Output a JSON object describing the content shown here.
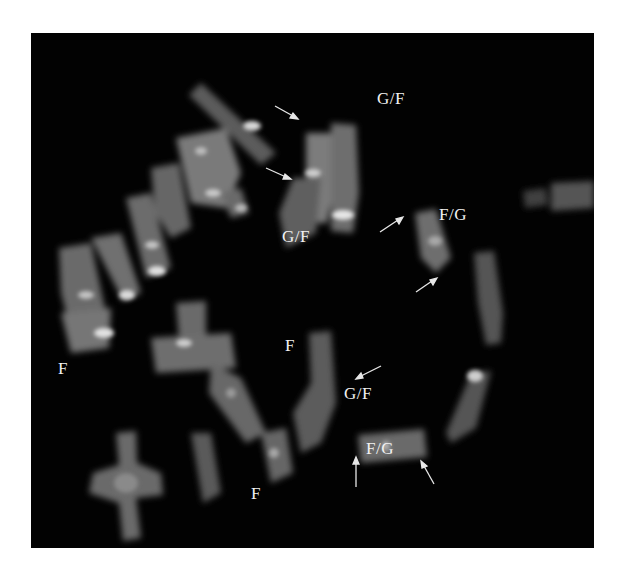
{
  "figure": {
    "type": "fluorescence metaphase chromosome spread",
    "background_color": "#020202",
    "label_color": "#f2f2f2",
    "labels": [
      {
        "id": "gf-top-right",
        "text": "G/F",
        "x": 346,
        "y": 57
      },
      {
        "id": "gf-top-center",
        "text": "G/F",
        "x": 251,
        "y": 195
      },
      {
        "id": "fg-right",
        "text": "F/G",
        "x": 408,
        "y": 173
      },
      {
        "id": "f-left",
        "text": "F",
        "x": 27,
        "y": 327
      },
      {
        "id": "f-center",
        "text": "F",
        "x": 254,
        "y": 304
      },
      {
        "id": "gf-bottom",
        "text": "G/F",
        "x": 313,
        "y": 352
      },
      {
        "id": "fg-bottom",
        "text": "F/G",
        "x": 335,
        "y": 407
      },
      {
        "id": "f-bottom",
        "text": "F",
        "x": 220,
        "y": 452
      }
    ],
    "arrows": [
      {
        "id": "arrow-1",
        "x1": 244,
        "y1": 73,
        "x2": 266,
        "y2": 85
      },
      {
        "id": "arrow-2",
        "x1": 235,
        "y1": 135,
        "x2": 259,
        "y2": 146
      },
      {
        "id": "arrow-3",
        "x1": 349,
        "y1": 199,
        "x2": 371,
        "y2": 185
      },
      {
        "id": "arrow-4",
        "x1": 385,
        "y1": 259,
        "x2": 405,
        "y2": 246
      },
      {
        "id": "arrow-5",
        "x1": 350,
        "y1": 333,
        "x2": 326,
        "y2": 345
      },
      {
        "id": "arrow-6",
        "x1": 325,
        "y1": 454,
        "x2": 325,
        "y2": 425
      },
      {
        "id": "arrow-7",
        "x1": 403,
        "y1": 451,
        "x2": 391,
        "y2": 429
      }
    ]
  }
}
